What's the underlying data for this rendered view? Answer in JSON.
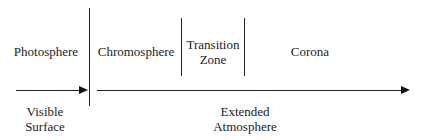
{
  "diagram": {
    "regions": [
      {
        "id": "photosphere",
        "label": "Photosphere"
      },
      {
        "id": "chromosphere",
        "label": "Chromosphere"
      },
      {
        "id": "transition-zone",
        "label_lines": [
          "Transition",
          "Zone"
        ]
      },
      {
        "id": "corona",
        "label": "Corona"
      }
    ],
    "arrows": [
      {
        "id": "visible-surface",
        "label_lines": [
          "Visible",
          "Surface"
        ]
      },
      {
        "id": "extended-atmosphere",
        "label_lines": [
          "Extended",
          "Atmosphere"
        ]
      }
    ],
    "colors": {
      "line": "#222222",
      "text": "#222222",
      "background": "#ffffff"
    }
  }
}
